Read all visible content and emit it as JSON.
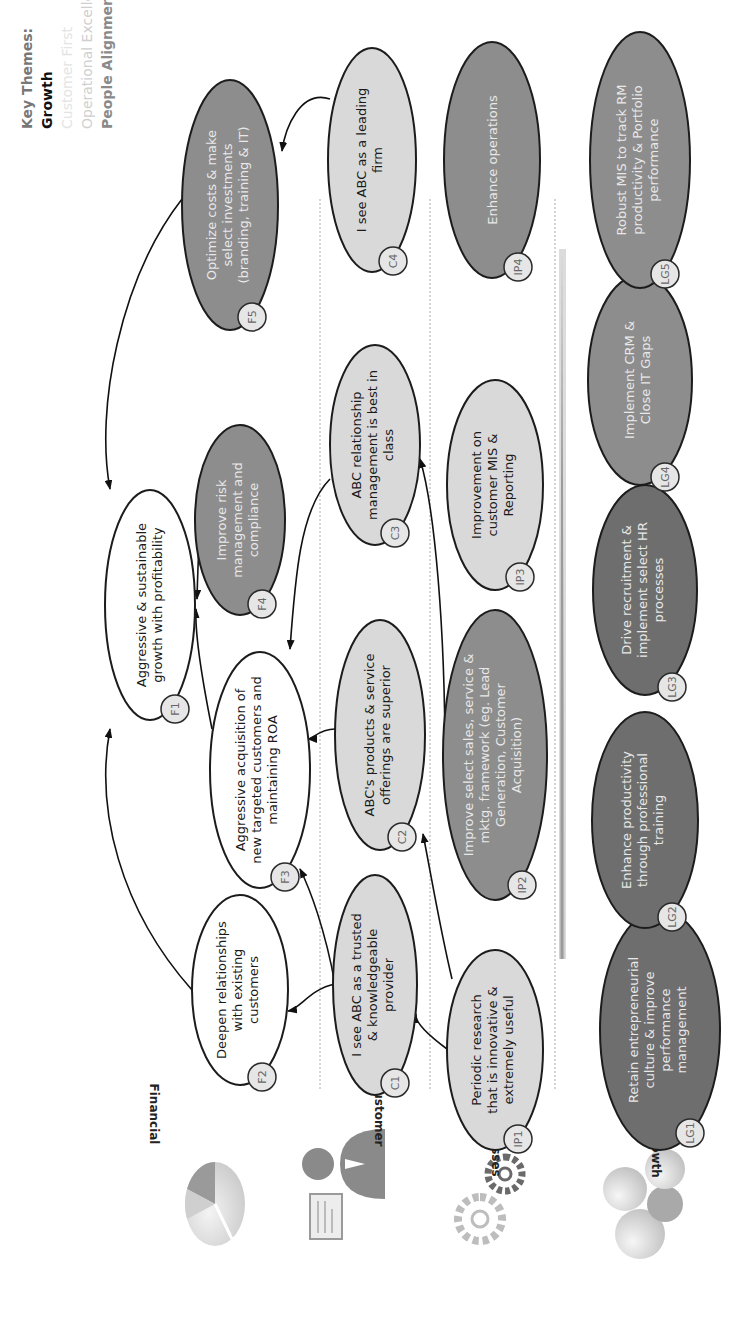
{
  "key_themes": {
    "title": "Key Themes:",
    "items": [
      {
        "label": "Growth",
        "emphasis": "active"
      },
      {
        "label": "Customer First",
        "emphasis": "faded"
      },
      {
        "label": "Operational Excellence",
        "emphasis": "faded"
      },
      {
        "label": "People Alignment",
        "emphasis": "semi"
      }
    ]
  },
  "perspectives": [
    {
      "label": "Financial",
      "icon": "pie-chart-icon"
    },
    {
      "label": "Customer",
      "icon": "presenter-person-icon"
    },
    {
      "label": "Internal Processes",
      "icon": "gears-icon"
    },
    {
      "label": "Learning & Growth",
      "icon": "puzzle-pieces-icon"
    }
  ],
  "nodes": {
    "F1": {
      "id": "F1",
      "lines": [
        "Aggressive & sustainable",
        "growth with profitability"
      ]
    },
    "F2": {
      "id": "F2",
      "lines": [
        "Deepen relationships",
        "with existing",
        "customers"
      ]
    },
    "F3": {
      "id": "F3",
      "lines": [
        "Aggressive acquisition of",
        "new targeted customers and",
        "maintaining ROA"
      ]
    },
    "F4": {
      "id": "F4",
      "lines": [
        "Improve risk",
        "management and",
        "compliance"
      ]
    },
    "F5": {
      "id": "F5",
      "lines": [
        "Optimize costs & make",
        "select investments",
        "(branding, training & IT)"
      ]
    },
    "C1": {
      "id": "C1",
      "lines": [
        "I see ABC as a trusted",
        "& knowledgeable",
        "provider"
      ]
    },
    "C2": {
      "id": "C2",
      "lines": [
        "ABC's products & service",
        "offerings are superior"
      ]
    },
    "C3": {
      "id": "C3",
      "lines": [
        "ABC relationship",
        "management is best in",
        "class"
      ]
    },
    "C4": {
      "id": "C4",
      "lines": [
        "I see ABC as a leading",
        "firm"
      ]
    },
    "IP1": {
      "id": "IP1",
      "lines": [
        "Periodic research",
        "that is innovative &",
        "extremely useful"
      ]
    },
    "IP2": {
      "id": "IP2",
      "lines": [
        "Improve select sales, service  &",
        "mktg. framework (eg. Lead",
        "Generation, Customer",
        "Acquisition)"
      ]
    },
    "IP3": {
      "id": "IP3",
      "lines": [
        "Improvement on",
        "customer MIS &",
        "Reporting"
      ]
    },
    "IP4": {
      "id": "IP4",
      "lines": [
        "Enhance operations"
      ]
    },
    "LG1": {
      "id": "LG1",
      "lines": [
        "Retain entrepreneurial",
        "culture & improve",
        "performance",
        "management"
      ]
    },
    "LG2": {
      "id": "LG2",
      "lines": [
        "Enhance productivity",
        "through professional",
        "training"
      ]
    },
    "LG3": {
      "id": "LG3",
      "lines": [
        "Drive recruitment &",
        "implement select HR",
        "processes"
      ]
    },
    "LG4": {
      "id": "LG4",
      "lines": [
        "Implement CRM &",
        "Close IT Gaps"
      ]
    },
    "LG5": {
      "id": "LG5",
      "lines": [
        "Robust MIS to track RM",
        "productivity & Portfolio",
        "performance"
      ]
    }
  },
  "links": [
    [
      "F2",
      "F1"
    ],
    [
      "F3",
      "F1"
    ],
    [
      "F4",
      "F1"
    ],
    [
      "F5",
      "F1"
    ],
    [
      "C1",
      "F2"
    ],
    [
      "C1",
      "F3"
    ],
    [
      "C2",
      "F3"
    ],
    [
      "C3",
      "F3"
    ],
    [
      "C4",
      "F5"
    ],
    [
      "IP1",
      "C1"
    ],
    [
      "IP1",
      "C2"
    ],
    [
      "IP2",
      "C3"
    ]
  ],
  "colors": {
    "white_fill": "#ffffff",
    "light_fill": "#d9d9d9",
    "mid_fill": "#8d8d8d",
    "dark_fill": "#6e6e6e",
    "outline": "#1c1c1c"
  }
}
